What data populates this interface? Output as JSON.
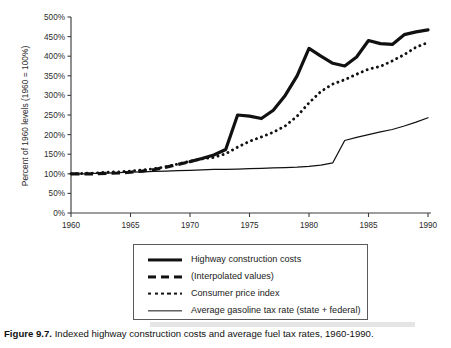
{
  "figure": {
    "caption_label": "Figure 9.7.",
    "caption_text": "Indexed highway construction costs and average fuel tax rates, 1960-1990."
  },
  "chart_data": {
    "type": "line",
    "title": "",
    "xlabel": "",
    "ylabel": "Percent of 1960 levels (1960 = 100%)",
    "xlim": [
      1960,
      1990
    ],
    "ylim": [
      0,
      500
    ],
    "xticks": [
      1960,
      1965,
      1970,
      1975,
      1980,
      1985,
      1990
    ],
    "xtick_labels": [
      "1960",
      "1965",
      "1970",
      "1975",
      "1980",
      "1985",
      "1990"
    ],
    "yticks": [
      0,
      50,
      100,
      150,
      200,
      250,
      300,
      350,
      400,
      450,
      500
    ],
    "ytick_labels": [
      "0%",
      "50%",
      "100%",
      "150%",
      "200%",
      "250%",
      "300%",
      "350%",
      "400%",
      "450%",
      "500%"
    ],
    "grid": false,
    "legend_position": "below-plot",
    "series": [
      {
        "name": "Highway construction costs",
        "style": "solid-thick",
        "x": [
          1970,
          1971,
          1972,
          1973,
          1974,
          1975,
          1976,
          1977,
          1978,
          1979,
          1980,
          1981,
          1982,
          1983,
          1984,
          1985,
          1986,
          1987,
          1988,
          1989,
          1990
        ],
        "values": [
          131,
          139,
          148,
          162,
          250,
          247,
          241,
          262,
          300,
          350,
          420,
          400,
          382,
          375,
          398,
          440,
          432,
          430,
          455,
          462,
          467
        ]
      },
      {
        "name": "(Interpolated values)",
        "style": "dashed-thick",
        "x": [
          1960,
          1961,
          1962,
          1963,
          1964,
          1965,
          1966,
          1967,
          1968,
          1969,
          1970
        ],
        "values": [
          100,
          100,
          100,
          101,
          102,
          104,
          107,
          111,
          117,
          124,
          131
        ]
      },
      {
        "name": "Consumer price index",
        "style": "dotted",
        "x": [
          1960,
          1961,
          1962,
          1963,
          1964,
          1965,
          1966,
          1967,
          1968,
          1969,
          1970,
          1971,
          1972,
          1973,
          1974,
          1975,
          1976,
          1977,
          1978,
          1979,
          1980,
          1981,
          1982,
          1983,
          1984,
          1985,
          1986,
          1987,
          1988,
          1989,
          1990
        ],
        "values": [
          100,
          101,
          102,
          104,
          105,
          107,
          110,
          113,
          118,
          125,
          132,
          138,
          142,
          151,
          168,
          183,
          194,
          206,
          222,
          247,
          281,
          310,
          329,
          340,
          354,
          367,
          374,
          388,
          404,
          423,
          435
        ]
      },
      {
        "name": "Average gasoline tax rate (state + federal)",
        "style": "solid-thin",
        "x": [
          1960,
          1961,
          1962,
          1963,
          1964,
          1965,
          1966,
          1967,
          1968,
          1969,
          1970,
          1971,
          1972,
          1973,
          1974,
          1975,
          1976,
          1977,
          1978,
          1979,
          1980,
          1981,
          1982,
          1983,
          1984,
          1985,
          1986,
          1987,
          1988,
          1989,
          1990
        ],
        "values": [
          100,
          100,
          101,
          102,
          103,
          104,
          105,
          106,
          107,
          108,
          109,
          110,
          111,
          111,
          112,
          113,
          114,
          115,
          116,
          117,
          119,
          122,
          128,
          185,
          193,
          200,
          207,
          213,
          222,
          232,
          243
        ]
      }
    ]
  },
  "legend": {
    "entries": [
      {
        "label": "Highway construction costs",
        "swatch": "solid-thick-line-swatch"
      },
      {
        "label": "(Interpolated values)",
        "swatch": "dashed-line-swatch"
      },
      {
        "label": "Consumer price index",
        "swatch": "dotted-line-swatch"
      },
      {
        "label": "Average gasoline tax rate (state + federal)",
        "swatch": "solid-thin-line-swatch"
      }
    ]
  }
}
